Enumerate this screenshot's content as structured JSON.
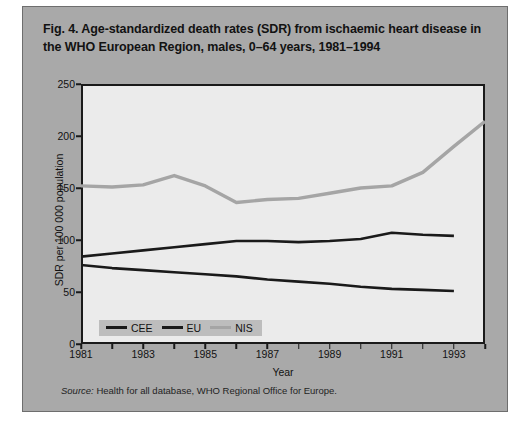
{
  "figure": {
    "title": "Fig. 4. Age-standardized death rates (SDR) from ischaemic heart disease in the WHO European Region, males, 0–64 years, 1981–1994",
    "source_keyword": "Source:",
    "source_text": " Health for all database, WHO Regional Office for Europe.",
    "panel_color": "#a9a9a9",
    "plot_background": "#ebebeb"
  },
  "chart_data": {
    "type": "line",
    "title": "Fig. 4. Age-standardized death rates (SDR) from ischaemic heart disease in the WHO European Region, males, 0–64 years, 1981–1994",
    "xlabel": "Year",
    "ylabel": "SDR per 100 000 population",
    "xlim": [
      1981,
      1994
    ],
    "ylim": [
      0,
      250
    ],
    "ytick_values": [
      0,
      50,
      100,
      150,
      200,
      250
    ],
    "ytick_labels": [
      "0",
      "50",
      "100",
      "150",
      "200",
      "250"
    ],
    "xtick_values": [
      1981,
      1982,
      1983,
      1984,
      1985,
      1986,
      1987,
      1988,
      1989,
      1990,
      1991,
      1992,
      1993,
      1994
    ],
    "xtick_labels": [
      "1981",
      "",
      "1983",
      "",
      "1985",
      "",
      "1987",
      "",
      "1989",
      "",
      "1991",
      "",
      "1993",
      ""
    ],
    "grid": false,
    "legend_position": "bottom-left",
    "x": [
      1981,
      1982,
      1983,
      1984,
      1985,
      1986,
      1987,
      1988,
      1989,
      1990,
      1991,
      1992,
      1993,
      1994
    ],
    "series": [
      {
        "name": "CEE",
        "color": "#1a1a1a",
        "width": 2.6,
        "values": [
          84,
          87,
          90,
          93,
          96,
          99,
          99,
          98,
          99,
          101,
          107,
          105,
          104,
          null
        ]
      },
      {
        "name": "EU",
        "color": "#1a1a1a",
        "width": 2.6,
        "values": [
          76,
          73,
          71,
          69,
          67,
          65,
          62,
          60,
          58,
          55,
          53,
          52,
          51,
          null
        ]
      },
      {
        "name": "NIS",
        "color": "#a5a5a5",
        "width": 3.4,
        "values": [
          152,
          151,
          153,
          162,
          152,
          136,
          139,
          140,
          145,
          150,
          152,
          165,
          190,
          214
        ]
      }
    ]
  }
}
